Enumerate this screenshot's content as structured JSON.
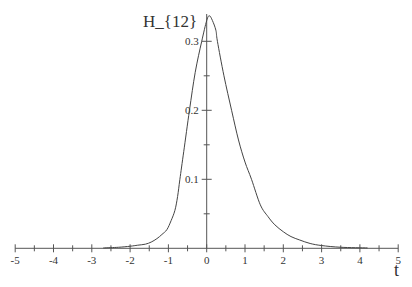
{
  "chart_data": {
    "type": "line",
    "title": "",
    "ylabel": "H_{12}",
    "xlabel": "t",
    "xlim": [
      -5,
      5
    ],
    "ylim": [
      0,
      0.34
    ],
    "grid": false,
    "legend": null,
    "x_ticks": [
      "-5",
      "-4",
      "-3",
      "-2",
      "-1",
      "0",
      "1",
      "2",
      "3",
      "4",
      "5"
    ],
    "y_ticks": [
      "0.1",
      "0.2",
      "0.3"
    ],
    "series": [
      {
        "name": "H_{12}",
        "x": [
          -2.7,
          -2.3,
          -2.0,
          -1.8,
          -1.6,
          -1.45,
          -1.3,
          -1.17,
          -1.04,
          -0.93,
          -0.83,
          -0.76,
          -0.7,
          -0.6,
          -0.45,
          -0.3,
          -0.13,
          0.0,
          0.07,
          0.15,
          0.24,
          0.28,
          0.45,
          0.65,
          0.83,
          1.0,
          1.17,
          1.4,
          1.6,
          1.78,
          2.0,
          2.2,
          2.43,
          2.7,
          3.0,
          3.5,
          4.2
        ],
        "values": [
          0.0005,
          0.0015,
          0.003,
          0.0045,
          0.006,
          0.009,
          0.014,
          0.02,
          0.027,
          0.04,
          0.055,
          0.075,
          0.1,
          0.14,
          0.2,
          0.255,
          0.3,
          0.33,
          0.337,
          0.33,
          0.316,
          0.3,
          0.25,
          0.2,
          0.157,
          0.125,
          0.1,
          0.063,
          0.046,
          0.034,
          0.024,
          0.017,
          0.012,
          0.007,
          0.004,
          0.0015,
          0.0005
        ]
      }
    ]
  },
  "labels": {
    "y_axis_title": "H_{12}",
    "x_axis_title": "t"
  },
  "style": {
    "axis_color": "#555555",
    "curve_color": "#444444"
  }
}
